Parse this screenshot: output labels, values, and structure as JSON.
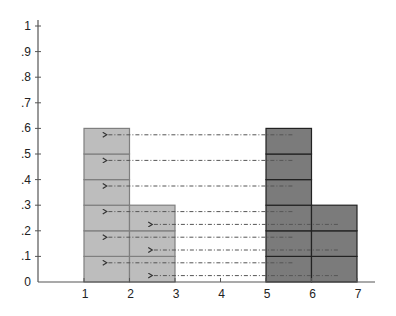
{
  "chart_data": {
    "type": "bar",
    "title": "",
    "xlabel": "",
    "ylabel": "",
    "xlim": [
      0,
      7.4
    ],
    "ylim": [
      0,
      1
    ],
    "grid": false,
    "legend": null,
    "x_ticks": [
      "1",
      "2",
      "3",
      "4",
      "5",
      "6",
      "7"
    ],
    "y_ticks": [
      {
        "value": 0,
        "label": "0"
      },
      {
        "value": 0.1,
        "label": ".1"
      },
      {
        "value": 0.2,
        "label": ".2"
      },
      {
        "value": 0.3,
        "label": ".3"
      },
      {
        "value": 0.4,
        "label": ".4"
      },
      {
        "value": 0.5,
        "label": ".5"
      },
      {
        "value": 0.6,
        "label": ".6"
      },
      {
        "value": 0.7,
        "label": ".7"
      },
      {
        "value": 0.8,
        "label": ".8"
      },
      {
        "value": 0.9,
        "label": ".9"
      },
      {
        "value": 1,
        "label": "1"
      }
    ],
    "series": [
      {
        "name": "source",
        "fill": "#bdbdbd",
        "stroke": "#7f7f7f",
        "bars": [
          {
            "x0": 1,
            "x1": 2,
            "height": 0.6
          },
          {
            "x0": 2,
            "x1": 3,
            "height": 0.3
          }
        ]
      },
      {
        "name": "target",
        "fill": "#7b7b7b",
        "stroke": "#222222",
        "bars": [
          {
            "x0": 5,
            "x1": 6,
            "height": 0.6
          },
          {
            "x0": 6,
            "x1": 7,
            "height": 0.3
          }
        ]
      }
    ],
    "cell_height": 0.1,
    "arrows": [
      {
        "from_x": 5.58,
        "to_x": 1.5,
        "y": 0.575
      },
      {
        "from_x": 5.58,
        "to_x": 1.5,
        "y": 0.475
      },
      {
        "from_x": 5.58,
        "to_x": 1.5,
        "y": 0.375
      },
      {
        "from_x": 5.58,
        "to_x": 1.5,
        "y": 0.275
      },
      {
        "from_x": 5.58,
        "to_x": 1.5,
        "y": 0.175
      },
      {
        "from_x": 5.58,
        "to_x": 1.5,
        "y": 0.075
      },
      {
        "from_x": 6.58,
        "to_x": 2.5,
        "y": 0.225
      },
      {
        "from_x": 6.58,
        "to_x": 2.5,
        "y": 0.125
      },
      {
        "from_x": 6.58,
        "to_x": 2.5,
        "y": 0.025
      }
    ],
    "arrow_color": "#555555",
    "axis_color": "#555555"
  }
}
